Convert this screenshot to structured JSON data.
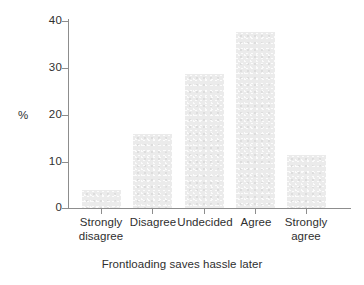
{
  "chart_data": {
    "type": "bar",
    "title": "",
    "subtitle": "",
    "xlabel": "Frontloading saves hassle later",
    "ylabel": "%",
    "categories": [
      "Strongly disagree",
      "Disagree",
      "Undecided",
      "Agree",
      "Strongly agree"
    ],
    "category_lines": [
      [
        "Strongly",
        "disagree"
      ],
      [
        "Disagree",
        ""
      ],
      [
        "Undecided",
        ""
      ],
      [
        "Agree",
        ""
      ],
      [
        "Strongly",
        "agree"
      ]
    ],
    "values": [
      4,
      16,
      28.7,
      37.8,
      11.5
    ],
    "ylim": [
      0,
      41
    ],
    "yticks": [
      0,
      10,
      20,
      30,
      40
    ],
    "ytick_labels": [
      "0",
      "10",
      "20",
      "30",
      "40"
    ],
    "grid": false,
    "legend": false,
    "legend_position": "none",
    "bar_color": "#ebebeb",
    "axis_color": "#8d8d8d",
    "text_color": "#2f2f2f"
  },
  "axes": {
    "y": {
      "label": "%",
      "ticks": [
        {
          "value": 40,
          "label": "40"
        },
        {
          "value": 30,
          "label": "30"
        },
        {
          "value": 20,
          "label": "20"
        },
        {
          "value": 10,
          "label": "10"
        },
        {
          "value": 0,
          "label": "0"
        }
      ]
    },
    "x": {
      "label": "Frontloading saves hassle later"
    }
  },
  "bars": [
    {
      "label_line1": "Strongly",
      "label_line2": "disagree",
      "value": 4
    },
    {
      "label_line1": "Disagree",
      "label_line2": "",
      "value": 16
    },
    {
      "label_line1": "Undecided",
      "label_line2": "",
      "value": 28.7
    },
    {
      "label_line1": "Agree",
      "label_line2": "",
      "value": 37.8
    },
    {
      "label_line1": "Strongly",
      "label_line2": "agree",
      "value": 11.5
    }
  ]
}
